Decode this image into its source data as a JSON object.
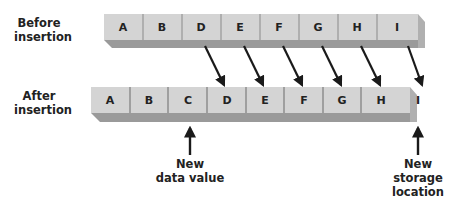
{
  "labels": {
    "before": "Before insertion",
    "before_line1": "Before",
    "before_line2": "insertion",
    "after_line1": "After",
    "after_line2": "insertion",
    "new_data_line1": "New",
    "new_data_line2": "data value",
    "new_storage_line1": "New",
    "new_storage_line2": "storage",
    "new_storage_line3": "location"
  },
  "before_row": [
    "A",
    "B",
    "D",
    "E",
    "F",
    "G",
    "H",
    "I"
  ],
  "after_row": [
    "A",
    "B",
    "C",
    "D",
    "E",
    "F",
    "G",
    "H",
    "I"
  ],
  "colors": {
    "cell_face": "#d4d4d4",
    "cell_bottom": "#9a9a9a",
    "cell_side": "#b0b0b0",
    "divider": "#777777",
    "arrow": "#1a1a1a",
    "text": "#222222"
  }
}
